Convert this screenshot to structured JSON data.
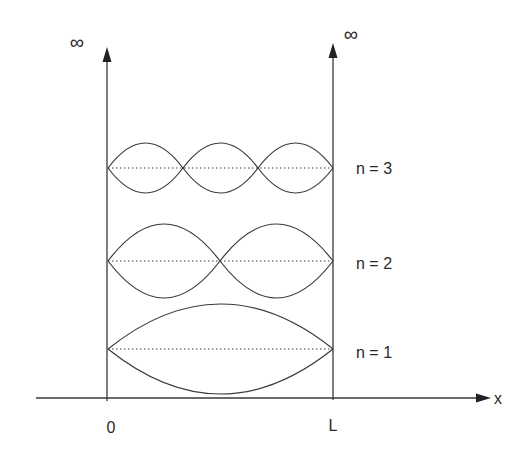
{
  "diagram": {
    "type": "infinite square well standing waves",
    "axis": {
      "x_label": "x",
      "origin_label": "0",
      "wall_label": "L",
      "left_wall_top_label": "∞",
      "right_wall_top_label": "∞"
    },
    "modes": [
      {
        "n": 1,
        "label": "n = 1",
        "lobes": 1
      },
      {
        "n": 2,
        "label": "n = 2",
        "lobes": 2
      },
      {
        "n": 3,
        "label": "n = 3",
        "lobes": 3
      }
    ],
    "colors": {
      "line": "#3a3a3a",
      "background": "#ffffff"
    }
  }
}
